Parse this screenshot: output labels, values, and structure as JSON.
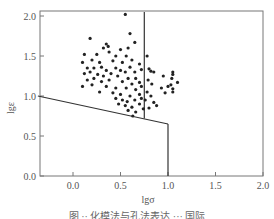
{
  "chart_data": {
    "type": "scatter",
    "title": "",
    "xlabel": "lgσ",
    "ylabel": "lgε",
    "xlim": [
      -0.37,
      2.0
    ],
    "ylim": [
      0.0,
      2.05
    ],
    "x_ticks": [
      "0.0",
      "0.5",
      "1.0",
      "1.5",
      "2.0"
    ],
    "y_ticks": [
      "0.0",
      "0.5",
      "1.0",
      "1.5",
      "2.0"
    ],
    "grid": false,
    "legend": null,
    "boundary_lines": [
      {
        "name": "vertical-divider",
        "points": [
          [
            0.75,
            2.05
          ],
          [
            0.75,
            0.72
          ]
        ]
      },
      {
        "name": "sloped-boundary",
        "points": [
          [
            -0.37,
            1.0
          ],
          [
            1.0,
            0.65
          ]
        ]
      },
      {
        "name": "right-vertical",
        "points": [
          [
            1.0,
            0.65
          ],
          [
            1.0,
            0.0
          ]
        ]
      }
    ],
    "points": [
      [
        0.55,
        2.02
      ],
      [
        0.6,
        1.78
      ],
      [
        0.65,
        1.67
      ],
      [
        0.18,
        1.72
      ],
      [
        0.35,
        1.65
      ],
      [
        0.37,
        1.62
      ],
      [
        0.32,
        1.6
      ],
      [
        0.5,
        1.58
      ],
      [
        0.58,
        1.6
      ],
      [
        0.12,
        1.52
      ],
      [
        0.25,
        1.52
      ],
      [
        0.38,
        1.55
      ],
      [
        0.45,
        1.5
      ],
      [
        0.56,
        1.5
      ],
      [
        0.1,
        1.42
      ],
      [
        0.2,
        1.45
      ],
      [
        0.28,
        1.42
      ],
      [
        0.42,
        1.44
      ],
      [
        0.52,
        1.42
      ],
      [
        0.62,
        1.45
      ],
      [
        0.7,
        1.4
      ],
      [
        0.15,
        1.35
      ],
      [
        0.22,
        1.35
      ],
      [
        0.3,
        1.36
      ],
      [
        0.35,
        1.32
      ],
      [
        0.45,
        1.35
      ],
      [
        0.5,
        1.32
      ],
      [
        0.55,
        1.3
      ],
      [
        0.6,
        1.36
      ],
      [
        0.65,
        1.3
      ],
      [
        0.72,
        1.33
      ],
      [
        0.12,
        1.28
      ],
      [
        0.18,
        1.3
      ],
      [
        0.26,
        1.27
      ],
      [
        0.32,
        1.25
      ],
      [
        0.4,
        1.28
      ],
      [
        0.47,
        1.25
      ],
      [
        0.58,
        1.22
      ],
      [
        0.66,
        1.22
      ],
      [
        0.15,
        1.2
      ],
      [
        0.22,
        1.22
      ],
      [
        0.3,
        1.18
      ],
      [
        0.38,
        1.2
      ],
      [
        0.52,
        1.18
      ],
      [
        0.62,
        1.15
      ],
      [
        0.7,
        1.17
      ],
      [
        0.1,
        1.12
      ],
      [
        0.2,
        1.14
      ],
      [
        0.35,
        1.12
      ],
      [
        0.45,
        1.1
      ],
      [
        0.56,
        1.1
      ],
      [
        0.66,
        1.08
      ],
      [
        0.72,
        1.12
      ],
      [
        0.28,
        1.05
      ],
      [
        0.42,
        1.04
      ],
      [
        0.5,
        1.02
      ],
      [
        0.6,
        1.0
      ],
      [
        0.7,
        1.02
      ],
      [
        0.45,
        0.97
      ],
      [
        0.52,
        0.95
      ],
      [
        0.57,
        0.93
      ],
      [
        0.65,
        0.95
      ],
      [
        0.72,
        0.97
      ],
      [
        0.48,
        0.9
      ],
      [
        0.55,
        0.88
      ],
      [
        0.62,
        0.86
      ],
      [
        0.7,
        0.9
      ],
      [
        0.58,
        0.82
      ],
      [
        0.66,
        0.8
      ],
      [
        0.74,
        0.84
      ],
      [
        0.63,
        0.75
      ],
      [
        0.78,
        1.5
      ],
      [
        0.8,
        1.34
      ],
      [
        0.82,
        1.31
      ],
      [
        0.85,
        1.3
      ],
      [
        0.79,
        1.2
      ],
      [
        0.83,
        1.15
      ],
      [
        0.95,
        1.25
      ],
      [
        1.04,
        1.22
      ],
      [
        1.05,
        1.27
      ],
      [
        1.05,
        1.3
      ],
      [
        1.1,
        1.17
      ],
      [
        1.03,
        1.14
      ],
      [
        1.0,
        1.12
      ],
      [
        0.93,
        1.1
      ],
      [
        0.97,
        1.04
      ],
      [
        1.05,
        1.05
      ],
      [
        1.05,
        1.09
      ],
      [
        0.78,
        1.05
      ],
      [
        0.82,
        1.0
      ],
      [
        0.76,
        0.95
      ],
      [
        0.85,
        0.92
      ],
      [
        0.88,
        0.88
      ],
      [
        0.8,
        0.85
      ]
    ]
  },
  "axes": {
    "x_label": "lgσ",
    "y_label": "lgε",
    "x_tick_labels": [
      "0.0",
      "0.5",
      "1.0",
      "1.5",
      "2.0"
    ],
    "y_tick_labels": [
      "0.0",
      "0.5",
      "1.0",
      "1.5",
      "2.0"
    ]
  },
  "caption": "图 ·· 化模法与孔法表达 ··· 国际"
}
